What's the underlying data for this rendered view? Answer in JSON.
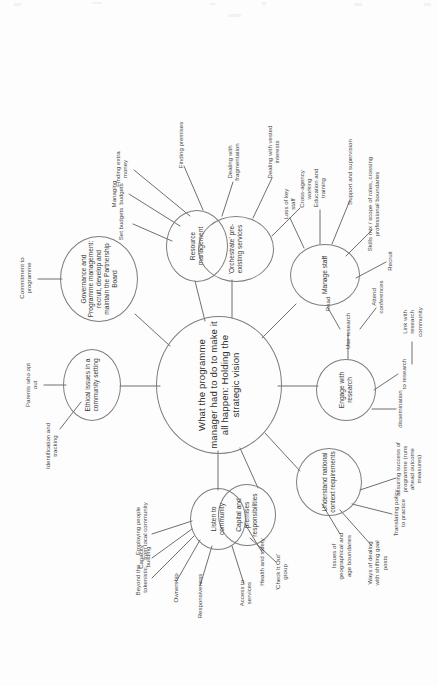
{
  "document": {
    "type": "mind-map",
    "orientation": "rotated-90-ccw",
    "background_color": "#fdfdfd",
    "ink_color": "#4a4a4a",
    "node_stroke_color": "#7d7d7d"
  },
  "central": {
    "label": "What the programme manager had to do to make it all happen: Holding the strategic vision"
  },
  "branches": [
    {
      "id": "ethical",
      "label": "Ethical issues in a community setting",
      "children": [
        {
          "label": "Identification and tracking"
        },
        {
          "label": "Parents who opt out"
        }
      ]
    },
    {
      "id": "governance",
      "label": "Governance and Programme management: recruit, develop and maintain the Partnership Board",
      "children": [
        {
          "label": "Commitment to programme"
        }
      ]
    },
    {
      "id": "resource",
      "label": "Resource management",
      "children": [
        {
          "label": "Set budgets"
        },
        {
          "label": "Managing budgets"
        },
        {
          "label": "Finding extra money"
        },
        {
          "label": "Finding premises"
        },
        {
          "label": "Dealing with fragmentation"
        }
      ]
    },
    {
      "id": "orchestrate",
      "label": "'Orchestrate' pre-existing services",
      "children": [
        {
          "label": "Dealing with vested interests"
        },
        {
          "label": "Cross-agency working"
        }
      ]
    },
    {
      "id": "manage-staff",
      "label": "Manage staff",
      "children": [
        {
          "label": "Loss of key staff"
        },
        {
          "label": "Education and training"
        },
        {
          "label": "Support and supervision"
        },
        {
          "label": "Skills mix / scope of roles, crossing professional boundaries"
        },
        {
          "label": "Recruit"
        }
      ]
    },
    {
      "id": "engage-research",
      "label": "Engage with research",
      "children": [
        {
          "label": "Use research"
        },
        {
          "label": "Read"
        },
        {
          "label": "Attend conferences"
        },
        {
          "label": "dissemination"
        },
        {
          "label": "to research"
        },
        {
          "label": "Link with research community"
        }
      ]
    },
    {
      "id": "national-context",
      "label": "Understand national context requirements",
      "children": [
        {
          "label": "Issues of geographical and age boundaries"
        },
        {
          "label": "Ways of dealing with shifting goal posts"
        },
        {
          "label": "Translating policy to practice"
        },
        {
          "label": "assuring success of programme (runs ahead outcome measures)"
        }
      ]
    },
    {
      "id": "capital-premises",
      "label": "Capital and premises responsibilities",
      "children": [
        {
          "label": "Health and safety"
        }
      ]
    },
    {
      "id": "listen-community",
      "label": "Listen to community",
      "children": [
        {
          "label": "Beyond the tokenistic"
        },
        {
          "label": "Capacity building"
        },
        {
          "label": "Employing people from local community"
        },
        {
          "label": "Ownership"
        },
        {
          "label": "Responsiveness"
        },
        {
          "label": "Access to services"
        },
        {
          "label": "'Check It Out' group"
        }
      ]
    }
  ]
}
